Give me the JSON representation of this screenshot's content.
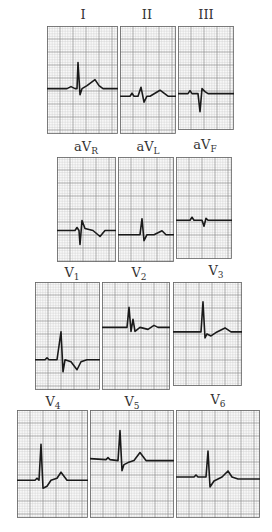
{
  "figure": {
    "grid_color_minor": "#c9c9c9",
    "grid_color_major": "#8a8a8a",
    "trace_color": "#1a1a1a",
    "rows": [
      {
        "leads": [
          {
            "id": "I",
            "label": "I",
            "sub": ""
          },
          {
            "id": "II",
            "label": "II",
            "sub": ""
          },
          {
            "id": "III",
            "label": "III",
            "sub": ""
          }
        ]
      },
      {
        "leads": [
          {
            "id": "aVR",
            "label": "aV",
            "sub": "R"
          },
          {
            "id": "aVL",
            "label": "aV",
            "sub": "L"
          },
          {
            "id": "aVF",
            "label": "aV",
            "sub": "F"
          }
        ]
      },
      {
        "leads": [
          {
            "id": "V1",
            "label": "V",
            "sub": "1"
          },
          {
            "id": "V2",
            "label": "V",
            "sub": "2"
          },
          {
            "id": "V3",
            "label": "V",
            "sub": "3"
          }
        ]
      },
      {
        "leads": [
          {
            "id": "V4",
            "label": "V",
            "sub": "4"
          },
          {
            "id": "V5",
            "label": "V",
            "sub": "5"
          },
          {
            "id": "V6",
            "label": "V",
            "sub": "6"
          }
        ]
      }
    ]
  }
}
